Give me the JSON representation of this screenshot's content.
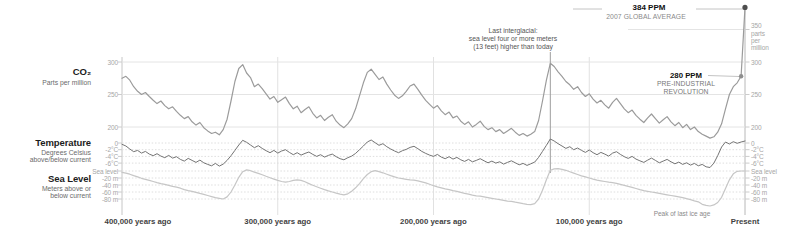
{
  "left_labels": {
    "co2_title": "CO₂",
    "co2_sub": "Parts per million",
    "temp_title": "Temperature",
    "temp_sub1": "Degrees Celsius",
    "temp_sub2": "above/below current",
    "sea_title": "Sea Level",
    "sea_sub1": "Meters above or",
    "sea_sub2": "below current"
  },
  "annotations": {
    "modern_label": "384 PPM",
    "modern_sub": "2007 GLOBAL AVERAGE",
    "preindustrial_label": "280 PPM",
    "preindustrial_sub1": "PRE-INDUSTRIAL",
    "preindustrial_sub2": "REVOLUTION",
    "interglacial_line1": "Last interglacial:",
    "interglacial_line2": "sea level four or more meters",
    "interglacial_line3": "(13 feet) higher than today",
    "ice_age_peak": "Peak of last ice age"
  },
  "x_axis": {
    "labels": [
      "400,000 years ago",
      "300,000 years ago",
      "200,000 years ago",
      "100,000 years ago",
      "Present"
    ]
  },
  "y_axes": {
    "co2": {
      "right_top_tick": "350",
      "unit_lines": [
        "parts",
        "per",
        "million"
      ],
      "ticks": [
        "300",
        "250",
        "200"
      ]
    },
    "temp": {
      "ticks": [
        "0",
        "-2°C",
        "-4°C",
        "-6°C"
      ]
    },
    "sea": {
      "ticks": [
        "Sea level",
        "-20 m",
        "-40 m",
        "-60 m",
        "-80 m"
      ]
    }
  },
  "colors": {
    "co2_line": "#9b9b9b",
    "temp_line": "#747474",
    "sea_line": "#c6c6c6",
    "co2_gridline": "#e4e4e4",
    "dotted_gridline": "#dedede",
    "time_gridline": "#e1e1e1",
    "axis_line": "#c6c6c6",
    "present_line": "#b8b8b8",
    "interglacial_line": "#9e9e9e",
    "leader": "#c4c4c4",
    "tick": "#cccccc",
    "marker_dark": "#4e4e4e",
    "marker_mid": "#8f8f8f"
  },
  "chart_data": {
    "type": "line",
    "x_start_kyr": 400,
    "x_step_kyr": -2.5,
    "x_gridlines_kyr": [
      400,
      300,
      200,
      100
    ],
    "interglacial_line_kyr": 125,
    "modern_co2_ppm": 384,
    "preindustrial_co2_ppm": 280,
    "gridlines": {
      "co2": [
        300,
        250,
        200
      ],
      "co2_right_partial": 350,
      "temp": [
        0,
        -2,
        -4,
        -6
      ],
      "sea": [
        0,
        -20,
        -40,
        -60,
        -80
      ]
    },
    "series": [
      {
        "name": "CO2",
        "unit": "ppm",
        "axis_ticks": [
          350,
          300,
          250,
          200
        ],
        "values": [
          275,
          278,
          272,
          262,
          255,
          250,
          253,
          247,
          241,
          236,
          240,
          233,
          228,
          231,
          224,
          218,
          213,
          216,
          208,
          203,
          207,
          199,
          194,
          190,
          192,
          188,
          196,
          212,
          240,
          270,
          290,
          296,
          283,
          276,
          262,
          266,
          259,
          251,
          243,
          247,
          238,
          242,
          246,
          236,
          228,
          232,
          222,
          227,
          231,
          221,
          214,
          218,
          210,
          215,
          219,
          209,
          203,
          199,
          205,
          213,
          228,
          248,
          268,
          284,
          289,
          281,
          273,
          277,
          266,
          257,
          249,
          244,
          248,
          255,
          263,
          266,
          258,
          249,
          241,
          235,
          229,
          233,
          225,
          219,
          223,
          214,
          217,
          209,
          204,
          208,
          200,
          204,
          209,
          201,
          196,
          199,
          193,
          196,
          190,
          194,
          198,
          192,
          187,
          190,
          186,
          189,
          193,
          210,
          240,
          272,
          298,
          293,
          285,
          278,
          270,
          265,
          258,
          262,
          253,
          247,
          251,
          243,
          237,
          241,
          234,
          229,
          238,
          244,
          236,
          228,
          222,
          226,
          218,
          212,
          207,
          214,
          220,
          213,
          206,
          211,
          216,
          208,
          202,
          207,
          199,
          204,
          196,
          200,
          193,
          189,
          186,
          183,
          185,
          192,
          205,
          228,
          250,
          262,
          268,
          278,
          384
        ]
      },
      {
        "name": "Temperature",
        "unit": "°C vs current",
        "axis_ticks": [
          0,
          -2,
          -4,
          -6
        ],
        "values": [
          -0.4,
          -0.9,
          -1.8,
          -2.6,
          -2.2,
          -3.0,
          -2.5,
          -3.3,
          -3.8,
          -3.2,
          -3.9,
          -4.4,
          -3.7,
          -4.5,
          -4.1,
          -4.9,
          -5.4,
          -4.6,
          -5.2,
          -5.8,
          -5.1,
          -5.9,
          -6.4,
          -6.8,
          -6.1,
          -6.9,
          -6.3,
          -5.2,
          -3.8,
          -2.2,
          -0.6,
          0.8,
          0.2,
          -0.6,
          -1.4,
          -0.8,
          -1.6,
          -2.3,
          -2.9,
          -2.2,
          -3.0,
          -2.4,
          -2.0,
          -2.8,
          -3.5,
          -2.9,
          -3.6,
          -3.1,
          -2.7,
          -3.4,
          -4.0,
          -3.5,
          -4.2,
          -3.7,
          -3.3,
          -4.1,
          -4.7,
          -5.0,
          -4.4,
          -3.9,
          -3.1,
          -2.0,
          -0.9,
          0.3,
          0.9,
          0.1,
          -0.7,
          -0.2,
          -1.1,
          -1.8,
          -2.4,
          -2.9,
          -2.3,
          -1.9,
          -1.3,
          -1.0,
          -1.7,
          -2.5,
          -3.1,
          -3.6,
          -4.0,
          -3.4,
          -4.2,
          -4.7,
          -4.1,
          -4.8,
          -4.3,
          -5.0,
          -5.5,
          -4.9,
          -5.6,
          -5.2,
          -4.7,
          -5.3,
          -5.9,
          -5.4,
          -6.0,
          -5.6,
          -6.3,
          -5.8,
          -5.3,
          -5.9,
          -6.5,
          -6.1,
          -6.7,
          -6.2,
          -5.7,
          -4.3,
          -2.5,
          -0.7,
          1.2,
          0.6,
          -0.2,
          -0.9,
          -1.6,
          -1.1,
          -2.0,
          -1.5,
          -2.2,
          -2.8,
          -2.1,
          -2.9,
          -3.5,
          -2.8,
          -3.3,
          -3.9,
          -3.0,
          -2.6,
          -3.4,
          -4.1,
          -4.6,
          -4.0,
          -4.8,
          -5.3,
          -5.8,
          -5.1,
          -4.5,
          -5.2,
          -5.9,
          -5.4,
          -4.9,
          -5.6,
          -6.2,
          -5.7,
          -6.4,
          -5.9,
          -6.6,
          -6.1,
          -6.8,
          -6.4,
          -7.1,
          -7.3,
          -6.0,
          -3.8,
          -1.2,
          0.3,
          -0.3,
          0.4,
          -0.1,
          0.3,
          0.6
        ]
      },
      {
        "name": "Sea Level",
        "unit": "m vs current",
        "axis_ticks": [
          0,
          -20,
          -40,
          -60,
          -80
        ],
        "values": [
          -4,
          -6,
          -9,
          -13,
          -17,
          -21,
          -24,
          -27,
          -30,
          -33,
          -36,
          -38,
          -41,
          -44,
          -46,
          -49,
          -53,
          -56,
          -58,
          -61,
          -64,
          -67,
          -70,
          -73,
          -76,
          -78,
          -80,
          -74,
          -60,
          -40,
          -18,
          -2,
          3,
          1,
          -3,
          -7,
          -11,
          -15,
          -19,
          -23,
          -27,
          -30,
          -32,
          -30,
          -27,
          -25,
          -27,
          -31,
          -36,
          -41,
          -45,
          -49,
          -53,
          -57,
          -60,
          -63,
          -66,
          -68,
          -65,
          -58,
          -48,
          -36,
          -22,
          -10,
          -2,
          1,
          -2,
          -5,
          -9,
          -13,
          -17,
          -20,
          -22,
          -24,
          -25,
          -26,
          -28,
          -31,
          -34,
          -38,
          -42,
          -45,
          -48,
          -51,
          -53,
          -56,
          -58,
          -61,
          -64,
          -66,
          -69,
          -71,
          -72,
          -74,
          -76,
          -78,
          -80,
          -82,
          -84,
          -86,
          -87,
          -89,
          -91,
          -93,
          -95,
          -96,
          -93,
          -80,
          -55,
          -25,
          2,
          6,
          7,
          5,
          2,
          -2,
          -6,
          -10,
          -14,
          -17,
          -20,
          -23,
          -26,
          -28,
          -30,
          -32,
          -33,
          -35,
          -38,
          -41,
          -44,
          -47,
          -50,
          -53,
          -56,
          -58,
          -60,
          -62,
          -64,
          -66,
          -68,
          -70,
          -72,
          -74,
          -76,
          -79,
          -82,
          -85,
          -88,
          -95,
          -98,
          -100,
          -97,
          -90,
          -75,
          -50,
          -25,
          -8,
          -1,
          0,
          0
        ]
      }
    ]
  }
}
